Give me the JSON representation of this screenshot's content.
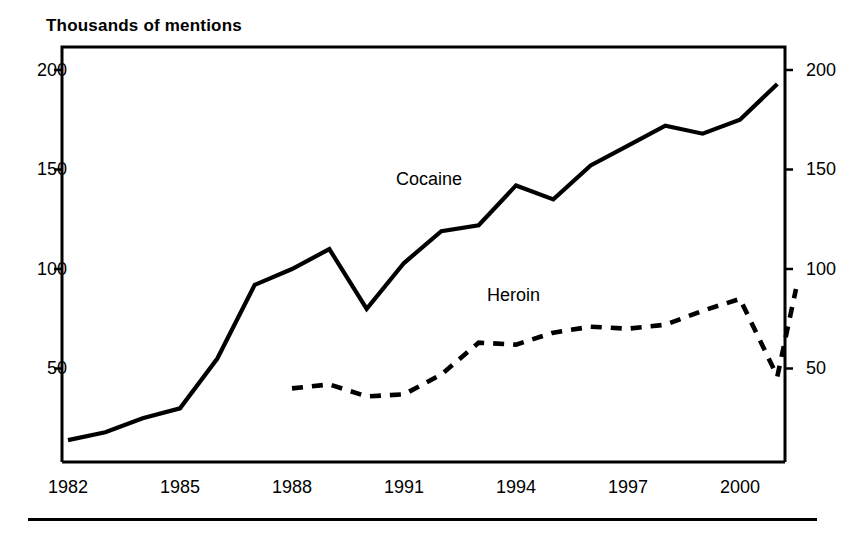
{
  "chart_data": {
    "type": "line",
    "title": "Thousands of mentions",
    "xlabel": "",
    "ylabel": "Thousands of mentions",
    "xlim": [
      1982,
      2001
    ],
    "ylim": [
      0,
      210
    ],
    "grid": false,
    "legend_position": "inline-annotations",
    "y_ticks": [
      50,
      100,
      150,
      200
    ],
    "y_tick_labels": [
      "50",
      "100",
      "150",
      "200"
    ],
    "x_ticks": [
      1982,
      1985,
      1988,
      1991,
      1994,
      1997,
      2000
    ],
    "x_tick_labels": [
      "1982",
      "1985",
      "1988",
      "1991",
      "1994",
      "1997",
      "2000"
    ],
    "dual_axis": true,
    "right_y_ticks": [
      50,
      100,
      150,
      200
    ],
    "right_y_tick_labels": [
      "50",
      "100",
      "150",
      "200"
    ],
    "series": [
      {
        "name": "Cocaine",
        "style": "solid",
        "color": "#000000",
        "x": [
          1982,
          1983,
          1984,
          1985,
          1986,
          1987,
          1988,
          1989,
          1990,
          1991,
          1992,
          1993,
          1994,
          1995,
          1996,
          1997,
          1998,
          1999,
          2000,
          2001
        ],
        "values": [
          14,
          18,
          25,
          30,
          55,
          92,
          100,
          110,
          80,
          103,
          119,
          122,
          142,
          135,
          152,
          162,
          172,
          168,
          175,
          193
        ],
        "label_x": 1991,
        "label_y": 170
      },
      {
        "name": "Heroin",
        "style": "dashed",
        "color": "#000000",
        "x": [
          1988,
          1989,
          1990,
          1991,
          1992,
          1993,
          1994,
          1995,
          1996,
          1997,
          1998,
          1999,
          2000,
          2001
        ],
        "values": [
          40,
          42,
          36,
          37,
          47,
          63,
          62,
          68,
          71,
          70,
          72,
          79,
          85,
          46
        ],
        "extra_x": [
          2001.5
        ],
        "extra_values": [
          90
        ],
        "label_x": 1994,
        "label_y": 90
      }
    ],
    "annotations": [
      {
        "text": "Cocaine",
        "x": 1991,
        "y": 170
      },
      {
        "text": "Heroin",
        "x": 1994,
        "y": 90
      }
    ]
  },
  "figure": {
    "title": "Thousands of mentions",
    "series_labels": {
      "cocaine": "Cocaine",
      "heroin": "Heroin"
    },
    "y_labels": {
      "t200": "200",
      "t150": "150",
      "t100": "100",
      "t50": "50"
    },
    "y_labels_right": {
      "t200": "200",
      "t150": "150",
      "t100": "100",
      "t50": "50"
    },
    "x_labels": {
      "x1982": "1982",
      "x1985": "1985",
      "x1988": "1988",
      "x1991": "1991",
      "x1994": "1994",
      "x1997": "1997",
      "x2000": "2000"
    },
    "colors": {
      "ink": "#000000",
      "background": "#ffffff"
    }
  }
}
